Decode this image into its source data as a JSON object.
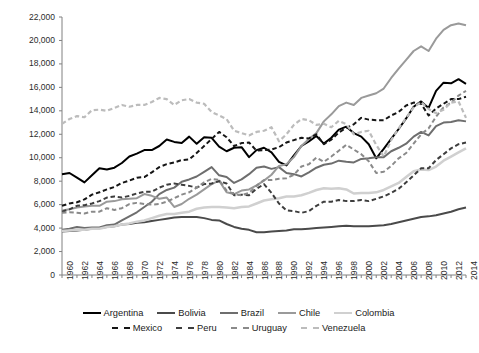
{
  "chart_data": {
    "type": "line",
    "title": "",
    "xlabel": "",
    "ylabel": "",
    "xlim": [
      1960,
      2014
    ],
    "ylim": [
      0,
      22000
    ],
    "grid": false,
    "legend_position": "bottom",
    "ytick_labels": [
      "0",
      "2,000",
      "4,000",
      "6,000",
      "8,000",
      "10,000",
      "12,000",
      "14,000",
      "16,000",
      "18,000",
      "20,000",
      "22,000"
    ],
    "ytick_values": [
      0,
      2000,
      4000,
      6000,
      8000,
      10000,
      12000,
      14000,
      16000,
      18000,
      20000,
      22000
    ],
    "xtick_labels": [
      "1960",
      "1962",
      "1964",
      "1966",
      "1968",
      "1970",
      "1972",
      "1974",
      "1976",
      "1978",
      "1980",
      "1982",
      "1984",
      "1986",
      "1988",
      "1990",
      "1992",
      "1994",
      "1996",
      "1998",
      "2000",
      "2002",
      "2004",
      "2006",
      "2008",
      "2010",
      "2012",
      "2014"
    ],
    "x": [
      1960,
      1961,
      1962,
      1963,
      1964,
      1965,
      1966,
      1967,
      1968,
      1969,
      1970,
      1971,
      1972,
      1973,
      1974,
      1975,
      1976,
      1977,
      1978,
      1979,
      1980,
      1981,
      1982,
      1983,
      1984,
      1985,
      1986,
      1987,
      1988,
      1989,
      1990,
      1991,
      1992,
      1993,
      1994,
      1995,
      1996,
      1997,
      1998,
      1999,
      2000,
      2001,
      2002,
      2003,
      2004,
      2005,
      2006,
      2007,
      2008,
      2009,
      2010,
      2011,
      2012,
      2013,
      2014
    ],
    "series": [
      {
        "name": "Argentina",
        "color": "#000000",
        "style": "solid",
        "width": 2.0,
        "values": [
          8600,
          8700,
          8300,
          7900,
          8500,
          9100,
          9000,
          9150,
          9550,
          10100,
          10350,
          10650,
          10650,
          11000,
          11550,
          11350,
          11250,
          11800,
          11200,
          11750,
          11700,
          10950,
          10550,
          10850,
          10900,
          10050,
          10650,
          10850,
          10450,
          9650,
          9350,
          10200,
          11000,
          11400,
          11850,
          11200,
          11700,
          12400,
          12650,
          12100,
          11800,
          11150,
          9950,
          10750,
          11600,
          12450,
          13350,
          14350,
          14800,
          14250,
          15700,
          16400,
          16350,
          16700,
          16300
        ]
      },
      {
        "name": "Bolivia",
        "color": "#4a4a4a",
        "style": "solid",
        "width": 2.0,
        "values": [
          3700,
          3750,
          3800,
          3850,
          3950,
          4000,
          4100,
          4150,
          4300,
          4350,
          4450,
          4500,
          4600,
          4700,
          4800,
          4900,
          4950,
          4950,
          4950,
          4850,
          4700,
          4650,
          4350,
          4100,
          3950,
          3850,
          3650,
          3650,
          3700,
          3750,
          3800,
          3900,
          3900,
          3950,
          4000,
          4050,
          4100,
          4150,
          4200,
          4150,
          4150,
          4150,
          4200,
          4250,
          4350,
          4500,
          4650,
          4800,
          4950,
          5000,
          5100,
          5250,
          5400,
          5600,
          5750
        ]
      },
      {
        "name": "Brazil",
        "color": "#6e6e6e",
        "style": "solid",
        "width": 2.0,
        "values": [
          3850,
          3950,
          4100,
          4000,
          4050,
          4050,
          4250,
          4300,
          4650,
          5000,
          5350,
          5800,
          6250,
          6900,
          7250,
          7450,
          7950,
          8150,
          8400,
          8800,
          9200,
          8500,
          8350,
          7850,
          8150,
          8600,
          9150,
          9250,
          9050,
          9200,
          8700,
          8600,
          8400,
          8750,
          9150,
          9400,
          9500,
          9750,
          9650,
          9600,
          9900,
          9950,
          10050,
          10050,
          10550,
          10850,
          11200,
          11800,
          12200,
          11900,
          12700,
          13000,
          13050,
          13200,
          13100
        ]
      },
      {
        "name": "Chile",
        "color": "#9a9a9a",
        "style": "solid",
        "width": 2.0,
        "values": [
          5500,
          5600,
          5750,
          5850,
          5900,
          5900,
          6250,
          6300,
          6450,
          6500,
          6550,
          6900,
          6750,
          6500,
          6600,
          5800,
          6050,
          6500,
          6850,
          7300,
          7750,
          8050,
          7050,
          6900,
          7200,
          7300,
          7650,
          8050,
          8550,
          9300,
          9450,
          10050,
          11000,
          11600,
          12100,
          13100,
          13700,
          14400,
          14700,
          14500,
          15100,
          15300,
          15500,
          15900,
          16800,
          17600,
          18350,
          19100,
          19500,
          19100,
          20150,
          20900,
          21300,
          21450,
          21300
        ]
      },
      {
        "name": "Colombia",
        "color": "#d0d0d0",
        "style": "solid",
        "width": 2.5,
        "values": [
          3750,
          3800,
          3850,
          3850,
          3950,
          3950,
          4100,
          4150,
          4300,
          4400,
          4550,
          4650,
          4850,
          5050,
          5200,
          5200,
          5300,
          5400,
          5650,
          5750,
          5800,
          5800,
          5750,
          5700,
          5800,
          5850,
          6100,
          6350,
          6450,
          6550,
          6700,
          6700,
          6800,
          7000,
          7250,
          7400,
          7350,
          7400,
          7300,
          6950,
          7000,
          7000,
          7050,
          7250,
          7550,
          7850,
          8350,
          8850,
          9000,
          8950,
          9250,
          9750,
          10100,
          10450,
          10800
        ]
      },
      {
        "name": "Mexico",
        "color": "#151515",
        "style": "dashed",
        "width": 2.0,
        "values": [
          5900,
          6100,
          6200,
          6450,
          6850,
          7050,
          7300,
          7500,
          7850,
          8050,
          8300,
          8350,
          8750,
          9200,
          9450,
          9600,
          9800,
          9850,
          10400,
          11000,
          11600,
          12200,
          11750,
          11000,
          11250,
          11300,
          10600,
          10650,
          10700,
          10900,
          11300,
          11500,
          11700,
          11650,
          12000,
          11150,
          11550,
          12150,
          12550,
          12850,
          13400,
          13250,
          13200,
          13200,
          13600,
          13900,
          14450,
          14700,
          14600,
          13600,
          14200,
          14600,
          15000,
          15000,
          15200
        ]
      },
      {
        "name": "Peru",
        "color": "#3d3d3d",
        "style": "dashed",
        "width": 2.0,
        "values": [
          5400,
          5600,
          5900,
          5950,
          6100,
          6300,
          6600,
          6700,
          6600,
          6750,
          6950,
          7100,
          7100,
          7450,
          7700,
          7800,
          7700,
          7600,
          7450,
          7750,
          7800,
          8000,
          7800,
          6800,
          6850,
          6800,
          7350,
          7750,
          7000,
          6100,
          5500,
          5450,
          5300,
          5450,
          5900,
          6250,
          6250,
          6400,
          6300,
          6300,
          6400,
          6300,
          6500,
          6700,
          7000,
          7350,
          7900,
          8500,
          9100,
          9100,
          9800,
          10300,
          10800,
          11150,
          11300
        ]
      },
      {
        "name": "Uruguay",
        "color": "#8a8a8a",
        "style": "dashed",
        "width": 2.0,
        "values": [
          5300,
          5350,
          5300,
          5250,
          5400,
          5400,
          5700,
          5550,
          5700,
          6050,
          6150,
          6050,
          6000,
          6050,
          6250,
          6550,
          6850,
          7050,
          7450,
          7900,
          8200,
          8100,
          7200,
          6900,
          6800,
          7000,
          7600,
          8100,
          8100,
          8200,
          8250,
          8550,
          9250,
          9450,
          10000,
          9650,
          10100,
          10600,
          11100,
          10700,
          10300,
          9700,
          8700,
          8800,
          9300,
          9950,
          10400,
          11200,
          12000,
          12500,
          13500,
          14300,
          14700,
          15300,
          15700
        ]
      },
      {
        "name": "Venezuela",
        "color": "#bcbcbc",
        "style": "dashed",
        "width": 2.2,
        "values": [
          12900,
          13300,
          13550,
          13450,
          14050,
          14100,
          14000,
          14250,
          14500,
          14350,
          14500,
          14500,
          14750,
          15100,
          15000,
          14500,
          14900,
          15000,
          14700,
          14600,
          13900,
          13600,
          13300,
          12300,
          12100,
          11900,
          12200,
          12300,
          12600,
          11400,
          12000,
          12800,
          13300,
          13200,
          12800,
          12900,
          12600,
          13150,
          12850,
          12000,
          12200,
          12300,
          11100,
          10100,
          11500,
          12500,
          13400,
          14300,
          14750,
          14150,
          13800,
          14100,
          14700,
          14800,
          13400
        ]
      }
    ]
  },
  "legend": {
    "rows": [
      [
        {
          "label": "Argentina",
          "color": "#000000",
          "style": "solid"
        },
        {
          "label": "Bolivia",
          "color": "#4a4a4a",
          "style": "solid"
        },
        {
          "label": "Brazil",
          "color": "#6e6e6e",
          "style": "solid"
        },
        {
          "label": "Chile",
          "color": "#9a9a9a",
          "style": "solid"
        },
        {
          "label": "Colombia",
          "color": "#d0d0d0",
          "style": "solid"
        }
      ],
      [
        {
          "label": "Mexico",
          "color": "#151515",
          "style": "dashed"
        },
        {
          "label": "Peru",
          "color": "#3d3d3d",
          "style": "dashed"
        },
        {
          "label": "Uruguay",
          "color": "#8a8a8a",
          "style": "dashed"
        },
        {
          "label": "Venezuela",
          "color": "#bcbcbc",
          "style": "dashed"
        }
      ]
    ]
  }
}
